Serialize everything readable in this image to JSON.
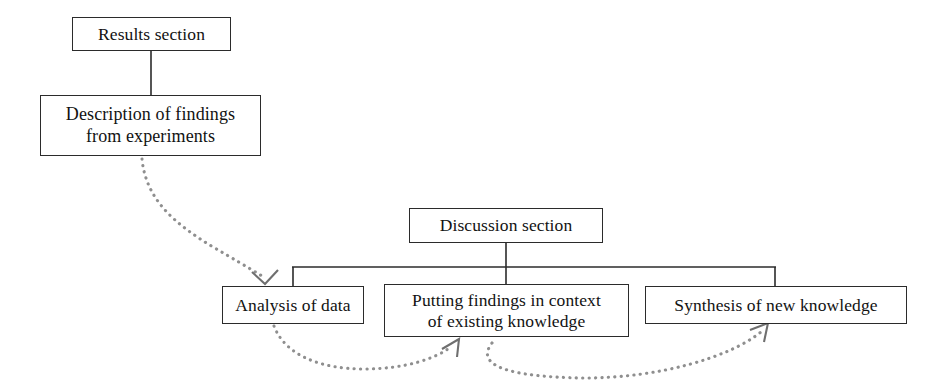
{
  "diagram": {
    "background_color": "#ffffff",
    "line_color": "#2b2b2b",
    "dotted_arrow_color": "#8a8a8a",
    "nodes": [
      {
        "id": "results",
        "label": "Results section"
      },
      {
        "id": "description",
        "label": "Description of findings\nfrom experiments"
      },
      {
        "id": "discussion",
        "label": "Discussion section"
      },
      {
        "id": "analysis",
        "label": "Analysis of data"
      },
      {
        "id": "context",
        "label": "Putting findings in context\nof existing knowledge"
      },
      {
        "id": "synthesis",
        "label": "Synthesis of new knowledge"
      }
    ],
    "connectors": [
      {
        "from": "results",
        "to": "description",
        "style": "solid",
        "arrow": false
      },
      {
        "from": "discussion",
        "to": "analysis",
        "style": "solid",
        "arrow": false
      },
      {
        "from": "discussion",
        "to": "context",
        "style": "solid",
        "arrow": false
      },
      {
        "from": "discussion",
        "to": "synthesis",
        "style": "solid",
        "arrow": false
      },
      {
        "from": "description",
        "to": "analysis",
        "style": "dotted",
        "arrow": true
      },
      {
        "from": "analysis",
        "to": "context",
        "style": "dotted",
        "arrow": true
      },
      {
        "from": "context",
        "to": "synthesis",
        "style": "dotted",
        "arrow": true
      }
    ]
  }
}
